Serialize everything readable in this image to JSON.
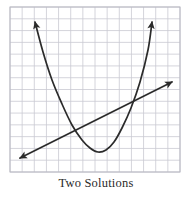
{
  "figure": {
    "caption": "Two Solutions",
    "background_color": "#ffffff",
    "grid": {
      "color": "#c9c9d2",
      "minor_color": "#dedee6",
      "x": 10,
      "y": 7,
      "width": 170,
      "height": 165,
      "cell_size": 12,
      "columns": 14,
      "rows": 14,
      "border_color": "#b8b8c2"
    },
    "curve_color": "#2b2b2b",
    "curve_width": 1.7
  },
  "chart_data": {
    "type": "line",
    "title": "Two Solutions",
    "xlabel": "",
    "ylabel": "",
    "grid": true,
    "legend": false,
    "annotations": [
      "Two Solutions"
    ],
    "xlim": [
      10,
      180
    ],
    "ylim": [
      7,
      172
    ],
    "series": [
      {
        "name": "parabola",
        "shape": "quadratic",
        "arrowheads": [
          "start",
          "end"
        ],
        "vertex": [
          98,
          152
        ],
        "left_endpoint": [
          35,
          22
        ],
        "right_endpoint": [
          152,
          22
        ],
        "points": [
          [
            35,
            22
          ],
          [
            43,
            52
          ],
          [
            52,
            80
          ],
          [
            62,
            104
          ],
          [
            72,
            125
          ],
          [
            82,
            140
          ],
          [
            90,
            148
          ],
          [
            98,
            152
          ],
          [
            106,
            150
          ],
          [
            114,
            142
          ],
          [
            122,
            128
          ],
          [
            131,
            108
          ],
          [
            140,
            82
          ],
          [
            148,
            50
          ],
          [
            152,
            22
          ]
        ]
      },
      {
        "name": "line",
        "shape": "linear",
        "arrowheads": [
          "start",
          "end"
        ],
        "left_endpoint": [
          20,
          158
        ],
        "right_endpoint": [
          172,
          82
        ],
        "points": [
          [
            20,
            158
          ],
          [
            172,
            82
          ]
        ]
      }
    ],
    "intersections": [
      {
        "label": "solution-1",
        "point": [
          73,
          131
        ]
      },
      {
        "label": "solution-2",
        "point": [
          134,
          103
        ]
      }
    ]
  }
}
